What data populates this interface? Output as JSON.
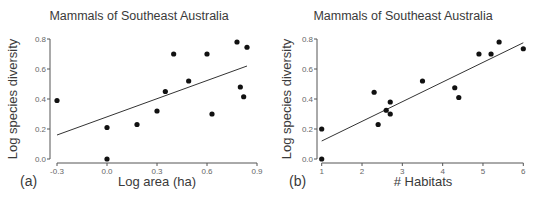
{
  "chart_data": [
    {
      "type": "scatter",
      "panel_label": "(a)",
      "title": "Mammals of Southeast Australia",
      "xlabel": "Log area (ha)",
      "ylabel": "Log species diversity",
      "xlim": [
        -0.3,
        0.9
      ],
      "ylim": [
        0.0,
        0.8
      ],
      "xticks": [
        -0.3,
        0.0,
        0.3,
        0.6,
        0.9
      ],
      "xtick_labels": [
        "-0.3",
        "0.0",
        "0.3",
        "0.6",
        "0.9"
      ],
      "yticks": [
        0.0,
        0.2,
        0.4,
        0.6,
        0.8
      ],
      "ytick_labels": [
        "0.0",
        "0.2",
        "0.4",
        "0.6",
        "0.8"
      ],
      "grid": false,
      "legend": null,
      "points": [
        {
          "x": -0.3,
          "y": 0.39
        },
        {
          "x": 0.0,
          "y": 0.21
        },
        {
          "x": 0.0,
          "y": 0.0
        },
        {
          "x": 0.18,
          "y": 0.23
        },
        {
          "x": 0.3,
          "y": 0.32
        },
        {
          "x": 0.35,
          "y": 0.45
        },
        {
          "x": 0.4,
          "y": 0.7
        },
        {
          "x": 0.49,
          "y": 0.52
        },
        {
          "x": 0.6,
          "y": 0.7
        },
        {
          "x": 0.63,
          "y": 0.3
        },
        {
          "x": 0.78,
          "y": 0.78
        },
        {
          "x": 0.8,
          "y": 0.48
        },
        {
          "x": 0.82,
          "y": 0.415
        },
        {
          "x": 0.84,
          "y": 0.745
        }
      ],
      "fit_line": {
        "x1": -0.3,
        "y1": 0.16,
        "x2": 0.84,
        "y2": 0.62
      }
    },
    {
      "type": "scatter",
      "panel_label": "(b)",
      "title": "Mammals of Southeast Australia",
      "xlabel": "# Habitats",
      "ylabel": "Log species diversity",
      "xlim": [
        1,
        6
      ],
      "ylim": [
        0.0,
        0.8
      ],
      "xticks": [
        1,
        2,
        3,
        4,
        5,
        6
      ],
      "xtick_labels": [
        "1",
        "2",
        "3",
        "4",
        "5",
        "6"
      ],
      "yticks": [
        0.0,
        0.2,
        0.4,
        0.6,
        0.8
      ],
      "ytick_labels": [
        "0.0",
        "0.2",
        "0.4",
        "0.6",
        "0.8"
      ],
      "grid": false,
      "legend": null,
      "points": [
        {
          "x": 1.0,
          "y": 0.2
        },
        {
          "x": 1.0,
          "y": 0.0
        },
        {
          "x": 2.3,
          "y": 0.445
        },
        {
          "x": 2.4,
          "y": 0.23
        },
        {
          "x": 2.6,
          "y": 0.325
        },
        {
          "x": 2.7,
          "y": 0.38
        },
        {
          "x": 2.7,
          "y": 0.3
        },
        {
          "x": 3.5,
          "y": 0.52
        },
        {
          "x": 4.3,
          "y": 0.475
        },
        {
          "x": 4.4,
          "y": 0.41
        },
        {
          "x": 4.9,
          "y": 0.7
        },
        {
          "x": 5.2,
          "y": 0.7
        },
        {
          "x": 5.4,
          "y": 0.78
        },
        {
          "x": 6.0,
          "y": 0.735
        }
      ],
      "fit_line": {
        "x1": 1.0,
        "y1": 0.12,
        "x2": 6.0,
        "y2": 0.775
      }
    }
  ]
}
